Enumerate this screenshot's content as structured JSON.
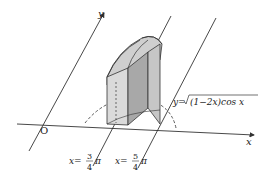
{
  "diagram": {
    "type": "3d-solid-volume-figure",
    "axes": {
      "x_label": "x",
      "y_label": "y",
      "origin_label": "O"
    },
    "curve_label": {
      "prefix": "y=",
      "radicand": "(1−2x)cos x"
    },
    "bounds": [
      {
        "name": "left-bound",
        "lhs": "x=",
        "numerator": "3",
        "denominator": "4",
        "suffix": "π"
      },
      {
        "name": "right-bound",
        "lhs": "x=",
        "numerator": "5",
        "denominator": "4",
        "suffix": "π"
      }
    ],
    "colors": {
      "stroke": "#333333",
      "fill_light": "#d4d4d4",
      "fill_mid": "#b8b8b8",
      "fill_dark": "#9a9a9a",
      "background": "#ffffff"
    }
  }
}
